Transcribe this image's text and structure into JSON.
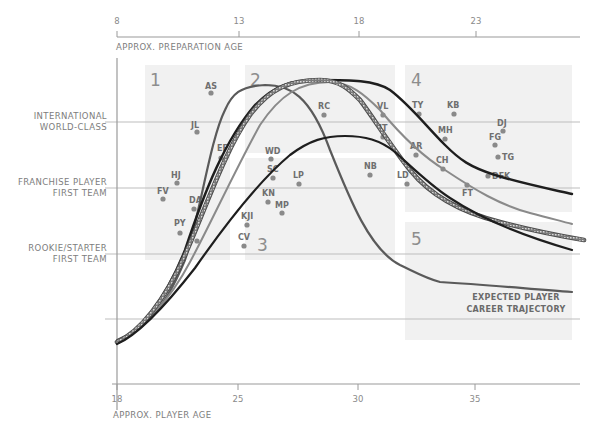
{
  "chart_data": {
    "type": "line",
    "title": "",
    "top_axis": {
      "label": "APPROX. PREPARATION AGE",
      "ticks": [
        {
          "label": "8",
          "x": 117
        },
        {
          "label": "13",
          "x": 239
        },
        {
          "label": "18",
          "x": 359
        },
        {
          "label": "23",
          "x": 476
        }
      ]
    },
    "xlabel": "APPROX. PLAYER AGE",
    "x_ticks": [
      {
        "label": "18",
        "x": 117
      },
      {
        "label": "25",
        "x": 238
      },
      {
        "label": "30",
        "x": 358
      },
      {
        "label": "35",
        "x": 475
      }
    ],
    "xlim": [
      18,
      39
    ],
    "y_levels": [
      {
        "lines": [
          "INTERNATIONAL",
          "WORLD-CLASS"
        ],
        "y": 122
      },
      {
        "lines": [
          "FRANCHISE PLAYER",
          "FIRST TEAM"
        ],
        "y": 188
      },
      {
        "lines": [
          "ROOKIE/STARTER",
          "FIRST TEAM"
        ],
        "y": 254
      },
      {
        "lines": [],
        "y": 319
      }
    ],
    "grid": true,
    "regions": [
      {
        "id": "1",
        "x": 145,
        "y": 65,
        "w": 85,
        "h": 195
      },
      {
        "id": "2",
        "x": 245,
        "y": 65,
        "w": 150,
        "h": 88
      },
      {
        "id": "3",
        "x": 245,
        "y": 158,
        "w": 150,
        "h": 102
      },
      {
        "id": "4",
        "x": 405,
        "y": 65,
        "w": 167,
        "h": 147
      },
      {
        "id": "5",
        "x": 405,
        "y": 222,
        "w": 167,
        "h": 118
      }
    ],
    "region_labels": [
      {
        "label": "1",
        "x": 150,
        "y": 86
      },
      {
        "label": "2",
        "x": 250,
        "y": 86
      },
      {
        "label": "3",
        "x": 257,
        "y": 251
      },
      {
        "label": "4",
        "x": 411,
        "y": 86
      },
      {
        "label": "5",
        "x": 411,
        "y": 245
      }
    ],
    "players": [
      {
        "label": "AS",
        "x": 211,
        "y": 93,
        "lx": 205,
        "ly": 89
      },
      {
        "label": "JL",
        "x": 197,
        "y": 132,
        "lx": 191,
        "ly": 128
      },
      {
        "label": "EF",
        "x": 221,
        "y": 158,
        "lx": 217,
        "ly": 151
      },
      {
        "label": "HJ",
        "x": 177,
        "y": 183,
        "lx": 171,
        "ly": 178
      },
      {
        "label": "FV",
        "x": 163,
        "y": 199,
        "lx": 157,
        "ly": 194
      },
      {
        "label": "DA",
        "x": 194,
        "y": 209,
        "lx": 189,
        "ly": 203
      },
      {
        "label": "PY",
        "x": 180,
        "y": 233,
        "lx": 174,
        "ly": 226
      },
      {
        "label": "",
        "x": 197,
        "y": 241
      },
      {
        "label": "WD",
        "x": 271,
        "y": 159,
        "lx": 265,
        "ly": 154
      },
      {
        "label": "SC",
        "x": 273,
        "y": 178,
        "lx": 267,
        "ly": 172
      },
      {
        "label": "LP",
        "x": 299,
        "y": 184,
        "lx": 293,
        "ly": 178
      },
      {
        "label": "KN",
        "x": 268,
        "y": 202,
        "lx": 262,
        "ly": 196
      },
      {
        "label": "MP",
        "x": 282,
        "y": 213,
        "lx": 275,
        "ly": 208
      },
      {
        "label": "KJI",
        "x": 247,
        "y": 225,
        "lx": 241,
        "ly": 219
      },
      {
        "label": "CV",
        "x": 244,
        "y": 246,
        "lx": 238,
        "ly": 240
      },
      {
        "label": "RC",
        "x": 324,
        "y": 115,
        "lx": 318,
        "ly": 109
      },
      {
        "label": "VL",
        "x": 383,
        "y": 115,
        "lx": 377,
        "ly": 109
      },
      {
        "label": "IT",
        "x": 383,
        "y": 137,
        "lx": 379,
        "ly": 131
      },
      {
        "label": "NB",
        "x": 370,
        "y": 175,
        "lx": 364,
        "ly": 169
      },
      {
        "label": "LD",
        "x": 407,
        "y": 184,
        "lx": 397,
        "ly": 178
      },
      {
        "label": "TY",
        "x": 419,
        "y": 114,
        "lx": 412,
        "ly": 108
      },
      {
        "label": "KB",
        "x": 454,
        "y": 114,
        "lx": 447,
        "ly": 108
      },
      {
        "label": "MH",
        "x": 445,
        "y": 139,
        "lx": 438,
        "ly": 133
      },
      {
        "label": "AR",
        "x": 416,
        "y": 155,
        "lx": 410,
        "ly": 149
      },
      {
        "label": "CH",
        "x": 443,
        "y": 169,
        "lx": 436,
        "ly": 163
      },
      {
        "label": "FT",
        "x": 467,
        "y": 185,
        "lx": 462,
        "ly": 196
      },
      {
        "label": "DJ",
        "x": 503,
        "y": 131,
        "lx": 497,
        "ly": 126
      },
      {
        "label": "FG",
        "x": 495,
        "y": 145,
        "lx": 489,
        "ly": 140
      },
      {
        "label": "TG",
        "x": 498,
        "y": 157,
        "lx": 502,
        "ly": 160
      },
      {
        "label": "DFK",
        "x": 488,
        "y": 176,
        "lx": 492,
        "ly": 179
      }
    ],
    "series": [
      {
        "name": "Expected player career trajectory",
        "style": "medium-gray-dark",
        "color": "#5a5a5a",
        "width": 2.2,
        "path": "M117,340 C140,330 160,320 185,260 C200,215 210,140 225,110 C232,94 240,86 265,85 C290,85 310,95 330,150 C350,200 370,250 400,265 C415,272 425,278 440,282 C490,285 530,289 572,292"
      },
      {
        "name": "Trajectory A (black, top)",
        "style": "black",
        "color": "#1e1e1e",
        "width": 2.4,
        "path": "M117,342 C140,332 165,300 185,250 C205,190 225,140 255,105 C275,85 290,80 320,80 C350,80 375,80 390,90 C410,105 425,125 445,145 C460,160 470,167 495,175 C520,183 545,188 572,194"
      },
      {
        "name": "Trajectory B (gray)",
        "style": "gray",
        "color": "#8a8a8a",
        "width": 2.0,
        "path": "M117,343 C140,333 170,300 190,262 C210,225 235,170 260,125 C280,95 300,82 330,82 C350,82 365,95 380,110 C395,128 420,155 445,170 C475,190 500,205 530,213 C550,218 560,221 572,224"
      },
      {
        "name": "Trajectory C (hatched)",
        "style": "hatched",
        "color": "#555555",
        "width": 3.4,
        "path": "M117,342 C140,332 165,300 185,255 C205,210 225,150 250,115 C270,88 290,80 320,80 C340,80 350,90 360,100 C375,120 390,145 410,170 C430,195 460,212 500,222 C530,230 555,235 584,240"
      },
      {
        "name": "Trajectory D (black, low peak)",
        "style": "black",
        "color": "#1e1e1e",
        "width": 2.2,
        "path": "M117,344 C140,334 170,300 195,268 C225,225 260,180 290,155 C310,140 325,136 345,136 C365,136 380,140 395,152 C415,170 430,185 450,198 C480,218 520,235 572,250"
      }
    ],
    "legend": {
      "lines": [
        "EXPECTED PLAYER",
        "CAREER TRAJECTORY"
      ],
      "x": 516,
      "y": 300
    }
  }
}
